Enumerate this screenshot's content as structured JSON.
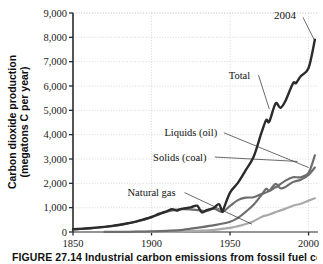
{
  "figure": {
    "caption": "FIGURE 27.14  Industrial carbon emissions from fossil fuel combustion"
  },
  "chart_data": {
    "type": "line",
    "title": "",
    "xlabel": "",
    "ylabel": "Carbon dioxide production (megatons C per year)",
    "ylabel_line1": "Carbon dioxide production",
    "ylabel_line2": "(megatons C per year)",
    "xlim": [
      1850,
      2006
    ],
    "ylim": [
      0,
      9000
    ],
    "grid": true,
    "legend_position": "inline-annotations",
    "xticks": [
      1850,
      1900,
      1950,
      2000
    ],
    "xtick_labels": [
      "1850",
      "1900",
      "1950",
      "2000"
    ],
    "yticks": [
      0,
      1000,
      2000,
      3000,
      4000,
      5000,
      6000,
      7000,
      8000,
      9000
    ],
    "ytick_labels": [
      "0",
      "1,000",
      "2,000",
      "3,000",
      "4,000",
      "5,000",
      "6,000",
      "7,000",
      "8,000",
      "9,000"
    ],
    "annotations": [
      {
        "text": "2004",
        "x": 1985,
        "y": 8900,
        "points_to_x": 2004,
        "points_to_y": 7850
      },
      {
        "text": "Total",
        "x": 1956,
        "y": 6450,
        "points_to_x": 1975,
        "points_to_y": 5050
      },
      {
        "text": "Liquids (oil)",
        "x": 1925,
        "y": 4080,
        "points_to_x": 2000,
        "points_to_y": 2650
      },
      {
        "text": "Solids (coal)",
        "x": 1918,
        "y": 3080,
        "points_to_x": 1993,
        "points_to_y": 2900
      },
      {
        "text": "Natural gas",
        "x": 1900,
        "y": 1620,
        "points_to_x": 1964,
        "points_to_y": 320
      }
    ],
    "series": [
      {
        "name": "Total",
        "color": "#2b2b2b",
        "width": 2.4,
        "x": [
          1850,
          1855,
          1860,
          1865,
          1870,
          1875,
          1880,
          1885,
          1890,
          1895,
          1900,
          1905,
          1910,
          1913,
          1916,
          1918,
          1920,
          1925,
          1929,
          1932,
          1935,
          1938,
          1940,
          1943,
          1945,
          1946,
          1950,
          1955,
          1960,
          1965,
          1970,
          1973,
          1975,
          1979,
          1982,
          1985,
          1990,
          1992,
          1995,
          2000,
          2004
        ],
        "y": [
          110,
          130,
          155,
          180,
          210,
          250,
          300,
          360,
          430,
          520,
          620,
          750,
          860,
          940,
          880,
          930,
          960,
          1000,
          1070,
          800,
          900,
          940,
          1000,
          1130,
          830,
          960,
          1250,
          1480,
          1660,
          2080,
          2580,
          2900,
          2750,
          3150,
          3050,
          3250,
          3610,
          3590,
          3800,
          4000,
          4700
        ],
        "y_scaled_note": "values in megatons C per year",
        "y_values": [
          110,
          130,
          155,
          180,
          210,
          250,
          300,
          360,
          430,
          520,
          620,
          750,
          860,
          940,
          880,
          930,
          960,
          1010,
          1080,
          810,
          900,
          950,
          1010,
          1140,
          840,
          970,
          1620,
          2020,
          2540,
          3090,
          4080,
          4600,
          4540,
          5280,
          5100,
          5350,
          6100,
          6120,
          6400,
          6740,
          7900
        ]
      },
      {
        "name": "Solids (coal)",
        "color": "#6d6d6d",
        "width": 2.2,
        "x": [
          1850,
          1860,
          1870,
          1880,
          1890,
          1900,
          1910,
          1920,
          1930,
          1935,
          1940,
          1945,
          1950,
          1955,
          1960,
          1965,
          1970,
          1975,
          1978,
          1980,
          1985,
          1990,
          1995,
          2000,
          2004
        ],
        "y_values": [
          105,
          150,
          205,
          295,
          420,
          600,
          840,
          940,
          900,
          860,
          960,
          830,
          1070,
          1310,
          1410,
          1430,
          1560,
          1680,
          1810,
          1870,
          2100,
          2250,
          2250,
          2430,
          3150
        ]
      },
      {
        "name": "Liquids (oil)",
        "color": "#6d6d6d",
        "width": 2.2,
        "x": [
          1870,
          1880,
          1890,
          1900,
          1910,
          1920,
          1930,
          1940,
          1950,
          1955,
          1960,
          1965,
          1970,
          1973,
          1975,
          1979,
          1982,
          1985,
          1990,
          1995,
          2000,
          2004
        ],
        "y_values": [
          3,
          6,
          12,
          25,
          50,
          90,
          180,
          280,
          420,
          580,
          830,
          1120,
          1520,
          1780,
          1700,
          1980,
          1800,
          1840,
          2050,
          2150,
          2350,
          2650
        ]
      },
      {
        "name": "Natural gas",
        "color": "#a9a9a9",
        "width": 2.2,
        "x": [
          1885,
          1900,
          1910,
          1920,
          1930,
          1940,
          1950,
          1955,
          1960,
          1965,
          1970,
          1975,
          1980,
          1985,
          1990,
          1995,
          2000,
          2004
        ],
        "y_values": [
          1,
          5,
          12,
          25,
          50,
          90,
          170,
          240,
          330,
          440,
          620,
          720,
          840,
          950,
          1080,
          1160,
          1290,
          1390
        ]
      }
    ]
  }
}
